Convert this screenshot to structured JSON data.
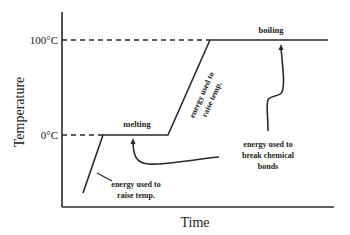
{
  "diagram": {
    "axes": {
      "x_label": "Time",
      "y_label": "Temperature",
      "y_ticks": [
        "100°C",
        "0°C"
      ]
    },
    "phases": {
      "melting": "melting",
      "boiling": "boiling"
    },
    "annotations": {
      "raise_temp_1_line1": "energy used to",
      "raise_temp_1_line2": "raise temp.",
      "raise_temp_2_line1": "energy used to",
      "raise_temp_2_line2": "raise temp.",
      "break_bonds_line1": "energy used to",
      "break_bonds_line2": "break chemical",
      "break_bonds_line3": "bonds"
    },
    "colors": {
      "line": "#2a2a2a",
      "text": "#222222",
      "background": "#ffffff"
    }
  }
}
